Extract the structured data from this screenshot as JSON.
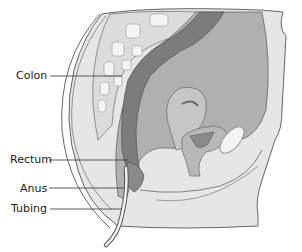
{
  "diagram": {
    "type": "anatomical-cross-section",
    "labels": [
      {
        "id": "colon",
        "text": "Colon"
      },
      {
        "id": "rectum",
        "text": "Rectum"
      },
      {
        "id": "anus",
        "text": "Anus"
      },
      {
        "id": "tubing",
        "text": "Tubing"
      }
    ],
    "colors": {
      "background": "#ffffff",
      "skin": "#e4e4e4",
      "outline": "#555555",
      "spine_bone": "#f2f2f2",
      "colon_dark": "#7a7a7a",
      "organ_mid": "#a9a9a9",
      "organ_light": "#c8c8c8",
      "leader_line": "#333333"
    }
  }
}
